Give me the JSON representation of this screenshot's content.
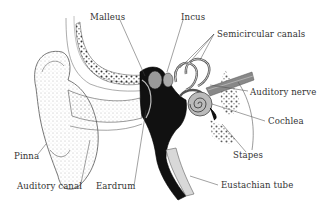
{
  "diagram": {
    "labels": [
      {
        "id": "malleus",
        "text": "Malleus",
        "x": 90,
        "y": 12
      },
      {
        "id": "incus",
        "text": "Incus",
        "x": 181,
        "y": 12
      },
      {
        "id": "semicircular-canals",
        "text": "Semicircular canals",
        "x": 217,
        "y": 29
      },
      {
        "id": "auditory-nerve",
        "text": "Auditory nerve",
        "x": 250,
        "y": 87
      },
      {
        "id": "cochlea",
        "text": "Cochlea",
        "x": 268,
        "y": 116
      },
      {
        "id": "stapes",
        "text": "Stapes",
        "x": 233,
        "y": 150
      },
      {
        "id": "eustachian-tube",
        "text": "Eustachian tube",
        "x": 221,
        "y": 180
      },
      {
        "id": "pinna",
        "text": "Pinna",
        "x": 14,
        "y": 151
      },
      {
        "id": "auditory-canal",
        "text": "Auditory canal",
        "x": 17,
        "y": 181
      },
      {
        "id": "eardrum",
        "text": "Eardrum",
        "x": 96,
        "y": 181
      }
    ]
  }
}
